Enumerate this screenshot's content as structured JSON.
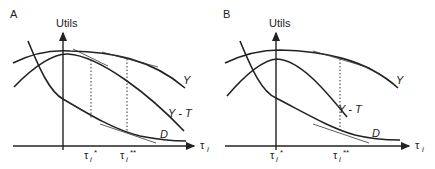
{
  "panels": [
    {
      "id": "A",
      "label": "A",
      "y_axis_label": "Utils",
      "x_axis_label": "τ",
      "x_axis_subscript": "i",
      "curves": {
        "y": "Y",
        "y_minus_t": "Y - T",
        "d": "D"
      },
      "ticks": [
        {
          "label": "τ",
          "sub": "i",
          "sup": "*"
        },
        {
          "label": "τ",
          "sub": "i",
          "sup": "**"
        }
      ]
    },
    {
      "id": "B",
      "label": "B",
      "y_axis_label": "Utils",
      "x_axis_label": "τ",
      "x_axis_subscript": "i",
      "curves": {
        "y": "Y",
        "y_minus_t": "Y - T",
        "d": "D"
      },
      "ticks": [
        {
          "label": "τ",
          "sub": "i",
          "sup": "*"
        },
        {
          "label": "τ",
          "sub": "i",
          "sup": "**"
        }
      ]
    }
  ]
}
